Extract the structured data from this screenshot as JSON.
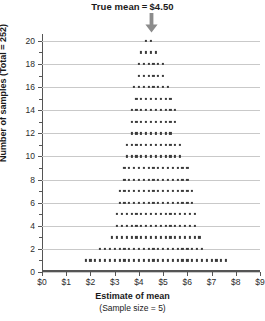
{
  "title": {
    "prefix": "True mean",
    "equals": "=",
    "value": "$4.50"
  },
  "annotation": {
    "arrow_icon": "down-arrow-icon",
    "arrow_at_x": 4.5,
    "arrow_color": "#8c8c8c"
  },
  "axes": {
    "y_title": "Number of samples (Total = 252)",
    "x_title": "Estimate of mean",
    "x_subtitle": "(Sample size = 5)",
    "y_ticks": [
      0,
      2,
      4,
      6,
      8,
      10,
      12,
      14,
      16,
      18,
      20
    ],
    "y_minor_ticks": [
      1,
      3,
      5,
      7,
      9,
      11,
      13,
      15,
      17,
      19
    ],
    "x_ticks": [
      "$0",
      "$1",
      "$2",
      "$3",
      "$4",
      "$5",
      "$6",
      "$7",
      "$8",
      "$9"
    ],
    "x_tick_values": [
      0,
      1,
      2,
      3,
      4,
      5,
      6,
      7,
      8,
      9
    ],
    "grid_color": "#c9c9c9",
    "axis_color": "#555555",
    "dot_color": "#3a3a3a"
  },
  "chart_data": {
    "type": "scatter",
    "plot_style": "dot-plot-stacked",
    "xlabel": "Estimate of mean (Sample size = 5)",
    "ylabel": "Number of samples (Total = 252)",
    "xlim": [
      0,
      9
    ],
    "ylim": [
      0,
      20.6
    ],
    "grid": true,
    "legend": null,
    "true_mean": 4.5,
    "total_samples": 252,
    "sample_size": 5,
    "dot_spacing_x": 0.2,
    "rows": [
      {
        "level": 20,
        "count": 2,
        "start": 4.3
      },
      {
        "level": 19,
        "count": 4,
        "start": 4.1
      },
      {
        "level": 18,
        "count": 6,
        "start": 4.0
      },
      {
        "level": 17,
        "count": 6,
        "start": 4.0
      },
      {
        "level": 16,
        "count": 8,
        "start": 3.8
      },
      {
        "level": 15,
        "count": 8,
        "start": 3.9
      },
      {
        "level": 14,
        "count": 10,
        "start": 3.7
      },
      {
        "level": 13,
        "count": 10,
        "start": 3.7
      },
      {
        "level": 12,
        "count": 9,
        "start": 3.7
      },
      {
        "level": 11,
        "count": 12,
        "start": 3.5
      },
      {
        "level": 10,
        "count": 12,
        "start": 3.5
      },
      {
        "level": 9,
        "count": 14,
        "start": 3.4
      },
      {
        "level": 8,
        "count": 14,
        "start": 3.4
      },
      {
        "level": 7,
        "count": 16,
        "start": 3.2
      },
      {
        "level": 6,
        "count": 16,
        "start": 3.2
      },
      {
        "level": 5,
        "count": 17,
        "start": 3.1
      },
      {
        "level": 4,
        "count": 17,
        "start": 3.1
      },
      {
        "level": 3,
        "count": 19,
        "start": 2.9
      },
      {
        "level": 2,
        "count": 22,
        "start": 2.4
      },
      {
        "level": 1,
        "count": 30,
        "start": 1.8
      }
    ]
  }
}
